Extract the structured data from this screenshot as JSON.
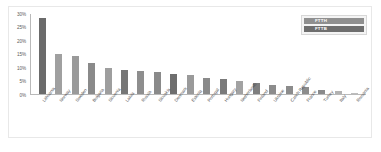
{
  "chart_data": {
    "type": "bar",
    "title": "",
    "subtitle": "",
    "xlabel": "",
    "ylabel": "",
    "ylim": [
      0,
      30
    ],
    "grid": false,
    "legend_position": "top-right",
    "ytick_labels": [
      "30%",
      "25%",
      "20%",
      "15%",
      "10%",
      "5%",
      "0%"
    ],
    "ytick_values": [
      30,
      25,
      20,
      15,
      10,
      5,
      0
    ],
    "categories": [
      "Lithuania",
      "Norway",
      "Sweden",
      "Bulgaria",
      "Slovenia",
      "Latvia",
      "Russia",
      "Slovakia",
      "Denmark",
      "Estonia",
      "Portugal",
      "Hungary",
      "Netherlands",
      "Finland",
      "Ukraine",
      "Czech Republic",
      "France",
      "Turkey",
      "Italy",
      "Romania"
    ],
    "values": [
      28.0,
      15.0,
      14.0,
      11.5,
      9.5,
      9.0,
      8.5,
      8.0,
      7.5,
      7.0,
      6.0,
      5.5,
      5.0,
      4.0,
      3.5,
      3.0,
      2.5,
      1.5,
      1.0,
      0.5
    ],
    "bar_colors": [
      "#6b6b6b",
      "#a0a0a0",
      "#9a9a9a",
      "#8a8a8a",
      "#9e9e9e",
      "#767676",
      "#8e8e8e",
      "#8a8a8a",
      "#6e6e6e",
      "#9a9a9a",
      "#8a8a8a",
      "#7a7a7a",
      "#a2a2a2",
      "#7e7e7e",
      "#8c8c8c",
      "#8c8c8c",
      "#8c8c8c",
      "#8a8a8a",
      "#b2b2b2",
      "#bdbdbd"
    ],
    "legend": [
      {
        "label": "FTTH",
        "color": "#8f8f8f"
      },
      {
        "label": "FTTB",
        "color": "#6e6e6e"
      }
    ]
  },
  "colors": {
    "axis": "#b9b9b9",
    "frame": "#e8e8e8",
    "tick_text": "#5a5a5a",
    "category_text": "#4e4e4e",
    "legend_bg": "#f4f4f4",
    "background": "#ffffff"
  }
}
